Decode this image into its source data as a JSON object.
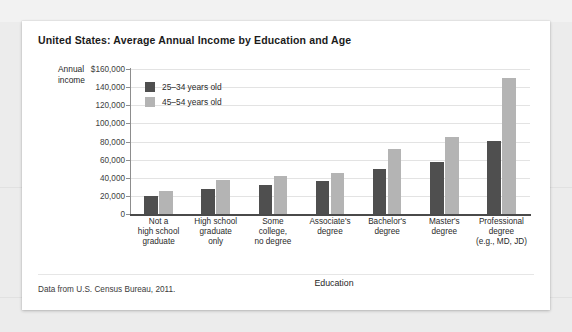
{
  "card": {
    "title": "United States: Average Annual Income by Education and Age",
    "source_note": "Data from U.S. Census Bureau, 2011."
  },
  "chart_data": {
    "type": "bar",
    "title": "United States: Average Annual Income by Education and Age",
    "xlabel": "Education",
    "ylabel": "Annual income",
    "ylabel_line1": "Annual",
    "ylabel_line2": "income",
    "ylim": [
      0,
      160000
    ],
    "ytick_values": [
      160000,
      140000,
      120000,
      100000,
      80000,
      60000,
      40000,
      20000,
      0
    ],
    "ytick_labels": [
      "$160,000",
      "140,000",
      "120,000",
      "100,000",
      "80,000",
      "60,000",
      "40,000",
      "20,000",
      "0"
    ],
    "grid": true,
    "legend_position": "upper-left-inside",
    "categories": [
      "Not a high school graduate",
      "High school graduate only",
      "Some college, no degree",
      "Associate's degree",
      "Bachelor's degree",
      "Master's degree",
      "Professional degree (e.g., MD, JD)"
    ],
    "category_label_lines": [
      [
        "Not a",
        "high school",
        "graduate"
      ],
      [
        "High school",
        "graduate",
        "only"
      ],
      [
        "Some",
        "college,",
        "no degree"
      ],
      [
        "Associate's",
        "degree"
      ],
      [
        "Bachelor's",
        "degree"
      ],
      [
        "Master's",
        "degree"
      ],
      [
        "Professional",
        "degree",
        "(e.g., MD, JD)"
      ]
    ],
    "series": [
      {
        "name": "25–34 years old",
        "color": "#4f4f4f",
        "values": [
          20000,
          28000,
          32000,
          36000,
          50000,
          57000,
          81000
        ]
      },
      {
        "name": "45–54 years old",
        "color": "#b4b4b4",
        "values": [
          25000,
          37000,
          42000,
          45000,
          72000,
          85000,
          150000
        ]
      }
    ]
  }
}
